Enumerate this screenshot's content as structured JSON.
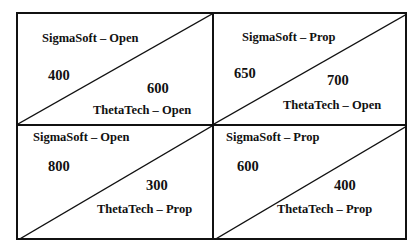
{
  "matrix": {
    "row_player": "SigmaSoft",
    "col_player": "ThetaTech",
    "cells": [
      {
        "row_label": "SigmaSoft – Open",
        "col_label": "ThetaTech – Open",
        "row_payoff": "400",
        "col_payoff": "600"
      },
      {
        "row_label": "SigmaSoft – Prop",
        "col_label": "ThetaTech – Open",
        "row_payoff": "650",
        "col_payoff": "700"
      },
      {
        "row_label": "SigmaSoft – Open",
        "col_label": "ThetaTech – Prop",
        "row_payoff": "800",
        "col_payoff": "300"
      },
      {
        "row_label": "SigmaSoft – Prop",
        "col_label": "ThetaTech – Prop",
        "row_payoff": "600",
        "col_payoff": "400"
      }
    ]
  }
}
